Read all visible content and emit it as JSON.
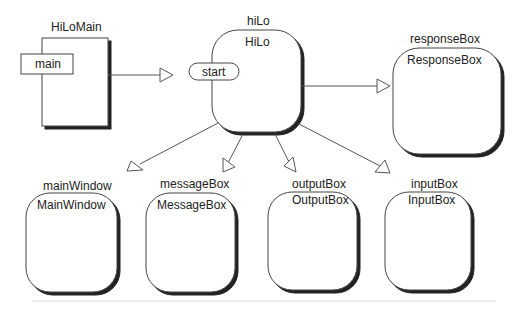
{
  "diagram": {
    "type": "object-collaboration",
    "colors": {
      "stroke": "#444444",
      "shadow": "#222222",
      "line": "#555555",
      "baseline": "#d8d8d8"
    },
    "nodes": [
      {
        "id": "hiLoMain",
        "instance": "HiLoMain",
        "operation": "main",
        "shape": "rectangle"
      },
      {
        "id": "hiLo",
        "instance": "hiLo",
        "class": "HiLo",
        "operation": "start",
        "shape": "rounded"
      },
      {
        "id": "responseBox",
        "instance": "responseBox",
        "class": "ResponseBox",
        "shape": "rounded"
      },
      {
        "id": "mainWindow",
        "instance": "mainWindow",
        "class": "MainWindow",
        "shape": "rounded"
      },
      {
        "id": "messageBox",
        "instance": "messageBox",
        "class": "MessageBox",
        "shape": "rounded"
      },
      {
        "id": "outputBox",
        "instance": "outputBox",
        "class": "OutputBox",
        "shape": "rounded"
      },
      {
        "id": "inputBox",
        "instance": "inputBox",
        "class": "InputBox",
        "shape": "rounded"
      }
    ],
    "edges": [
      {
        "from": "hiLoMain",
        "to": "hiLo"
      },
      {
        "from": "hiLo",
        "to": "responseBox"
      },
      {
        "from": "hiLo",
        "to": "mainWindow"
      },
      {
        "from": "hiLo",
        "to": "messageBox"
      },
      {
        "from": "hiLo",
        "to": "outputBox"
      },
      {
        "from": "hiLo",
        "to": "inputBox"
      }
    ]
  }
}
